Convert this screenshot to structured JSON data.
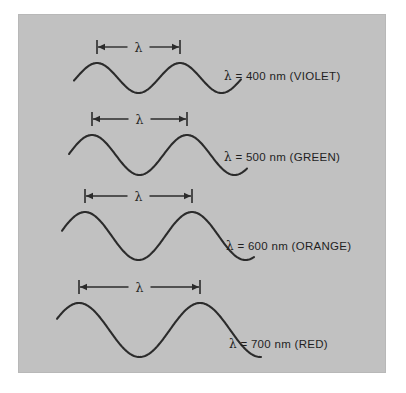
{
  "figure": {
    "panel_color": "#c1c1c1",
    "page_background": "#ffffff",
    "stroke_color": "#2b2b2b",
    "dimension_symbol": "λ"
  },
  "chart_data": {
    "type": "line",
    "xlabel": "",
    "ylabel": "",
    "grid": false,
    "legend": "inline-right",
    "annotation_symbol": "λ",
    "series": [
      {
        "name": "violet",
        "label": "λ = 400 nm  (VIOLET)",
        "lambda_nm": 400,
        "color_name": "VIOLET",
        "wavelength_px": 83,
        "amplitude_px": 15,
        "centerline_y_px": 78,
        "dimension_left_px": 97,
        "dimension_right_px": 180
      },
      {
        "name": "green",
        "label": "λ = 500 nm  (GREEN)",
        "lambda_nm": 500,
        "color_name": "GREEN",
        "wavelength_px": 95,
        "amplitude_px": 20,
        "centerline_y_px": 155,
        "dimension_left_px": 92,
        "dimension_right_px": 187
      },
      {
        "name": "orange",
        "label": "λ = 600 nm (ORANGE)",
        "lambda_nm": 600,
        "color_name": "ORANGE",
        "wavelength_px": 107,
        "amplitude_px": 24,
        "centerline_y_px": 236,
        "dimension_left_px": 85,
        "dimension_right_px": 192
      },
      {
        "name": "red",
        "label": "λ = 700 nm (RED)",
        "lambda_nm": 700,
        "color_name": "RED",
        "wavelength_px": 121,
        "amplitude_px": 27,
        "centerline_y_px": 330,
        "dimension_left_px": 79,
        "dimension_right_px": 200
      }
    ]
  },
  "labels": {
    "violet": "λ = 400 nm  (VIOLET)",
    "green": "λ = 500 nm  (GREEN)",
    "orange": "λ = 600 nm (ORANGE)",
    "red": "λ = 700 nm (RED)"
  },
  "dimension_labels": {
    "violet": "λ",
    "green": "λ",
    "orange": "λ",
    "red": "λ"
  }
}
